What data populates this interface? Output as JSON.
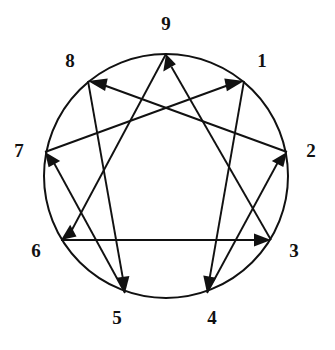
{
  "diagram": {
    "name": "Enneagram",
    "type": "enneagram-symbol",
    "stroke_color": "#111111",
    "background_color": "#ffffff",
    "circle": {
      "center_x": 166,
      "center_y": 176,
      "radius": 122
    },
    "labels": [
      {
        "text": "9",
        "x": 166,
        "y": 26
      },
      {
        "text": "1",
        "x": 262,
        "y": 63
      },
      {
        "text": "2",
        "x": 311,
        "y": 153
      },
      {
        "text": "3",
        "x": 294,
        "y": 253
      },
      {
        "text": "4",
        "x": 212,
        "y": 320
      },
      {
        "text": "5",
        "x": 117,
        "y": 320
      },
      {
        "text": "6",
        "x": 36,
        "y": 253
      },
      {
        "text": "7",
        "x": 19,
        "y": 153
      },
      {
        "text": "8",
        "x": 70,
        "y": 63
      }
    ],
    "vertices": [
      {
        "id": "9",
        "x": 166,
        "y": 54
      },
      {
        "id": "1",
        "x": 244,
        "y": 81
      },
      {
        "id": "2",
        "x": 287,
        "y": 152
      },
      {
        "id": "3",
        "x": 271,
        "y": 240
      },
      {
        "id": "4",
        "x": 207,
        "y": 293
      },
      {
        "id": "5",
        "x": 125,
        "y": 293
      },
      {
        "id": "6",
        "x": 61,
        "y": 240
      },
      {
        "id": "7",
        "x": 45,
        "y": 152
      },
      {
        "id": "8",
        "x": 88,
        "y": 81
      }
    ],
    "triangle": {
      "name": "law-of-three-triangle",
      "sequence": [
        "9",
        "6",
        "3",
        "9"
      ],
      "arrows": [
        "9 to 6",
        "6 to 3",
        "3 to 9"
      ]
    },
    "hexad": {
      "name": "law-of-seven-hexad",
      "sequence": [
        "1",
        "4",
        "2",
        "8",
        "5",
        "7",
        "1"
      ],
      "arrows": [
        "1 to 4",
        "4 to 2",
        "2 to 8",
        "8 to 5",
        "5 to 7",
        "7 to 1"
      ]
    }
  }
}
